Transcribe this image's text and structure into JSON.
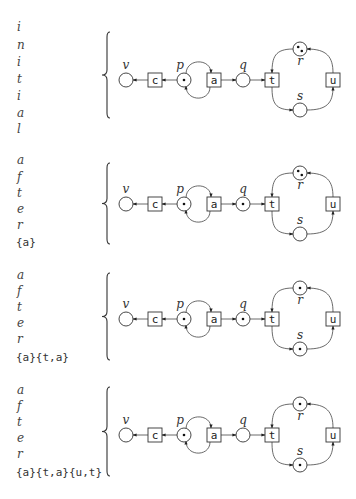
{
  "figure": {
    "net": {
      "places": [
        {
          "id": "v",
          "label": "v",
          "dx": 126,
          "dy": 0
        },
        {
          "id": "p",
          "label": "p",
          "dx": 184,
          "dy": 0
        },
        {
          "id": "q",
          "label": "q",
          "dx": 243,
          "dy": 0
        },
        {
          "id": "r",
          "label": "r",
          "dx": 300,
          "dy": -31
        },
        {
          "id": "s",
          "label": "s",
          "dx": 300,
          "dy": 30
        }
      ],
      "transitions": [
        {
          "id": "c",
          "label": "c",
          "dx": 155,
          "dy": 0
        },
        {
          "id": "a",
          "label": "a",
          "dx": 214,
          "dy": 0
        },
        {
          "id": "t",
          "label": "t",
          "dx": 272,
          "dy": 0
        },
        {
          "id": "u",
          "label": "u",
          "dx": 333,
          "dy": 0
        }
      ],
      "arcs": [
        {
          "from": "c",
          "to": "v"
        },
        {
          "from": "p",
          "to": "c"
        },
        {
          "from": "p",
          "to": "a",
          "curve": "top"
        },
        {
          "from": "a",
          "to": "p",
          "curve": "bottom"
        },
        {
          "from": "a",
          "to": "q"
        },
        {
          "from": "q",
          "to": "t"
        },
        {
          "from": "r",
          "to": "t"
        },
        {
          "from": "t",
          "to": "s"
        },
        {
          "from": "s",
          "to": "u"
        },
        {
          "from": "u",
          "to": "r"
        }
      ]
    },
    "panels": [
      {
        "id": "initial",
        "title_letters": [
          "i",
          "n",
          "i",
          "t",
          "i",
          "a",
          "l"
        ],
        "sequence": "",
        "row_y": 80,
        "letter_y": [
          27,
          45,
          62,
          79,
          96,
          113,
          129
        ],
        "brace": {
          "top": 32,
          "bottom": 118
        },
        "marking": {
          "v": 0,
          "p": 1,
          "q": 0,
          "r": 2,
          "s": 0
        }
      },
      {
        "id": "after-a",
        "title_letters": [
          "a",
          "f",
          "t",
          "e",
          "r"
        ],
        "sequence": "{a}",
        "row_y": 204,
        "letter_y": [
          160,
          177,
          193,
          209,
          225
        ],
        "sequence_y": 242,
        "brace": {
          "top": 163,
          "bottom": 244
        },
        "marking": {
          "v": 0,
          "p": 1,
          "q": 1,
          "r": 2,
          "s": 0
        }
      },
      {
        "id": "after-a-ta",
        "title_letters": [
          "a",
          "f",
          "t",
          "e",
          "r"
        ],
        "sequence": "{a}{t,a}",
        "row_y": 319,
        "letter_y": [
          275,
          291,
          307,
          323,
          339
        ],
        "sequence_y": 357,
        "brace": {
          "top": 273,
          "bottom": 360
        },
        "marking": {
          "v": 0,
          "p": 1,
          "q": 1,
          "r": 1,
          "s": 1
        }
      },
      {
        "id": "after-a-ta-ut",
        "title_letters": [
          "a",
          "f",
          "t",
          "e",
          "r"
        ],
        "sequence": "{a}{t,a}{u,t}",
        "row_y": 435,
        "letter_y": [
          390,
          406,
          422,
          438,
          454
        ],
        "sequence_y": 472,
        "brace": {
          "top": 387,
          "bottom": 476
        },
        "marking": {
          "v": 0,
          "p": 1,
          "q": 0,
          "r": 1,
          "s": 1
        }
      }
    ]
  }
}
